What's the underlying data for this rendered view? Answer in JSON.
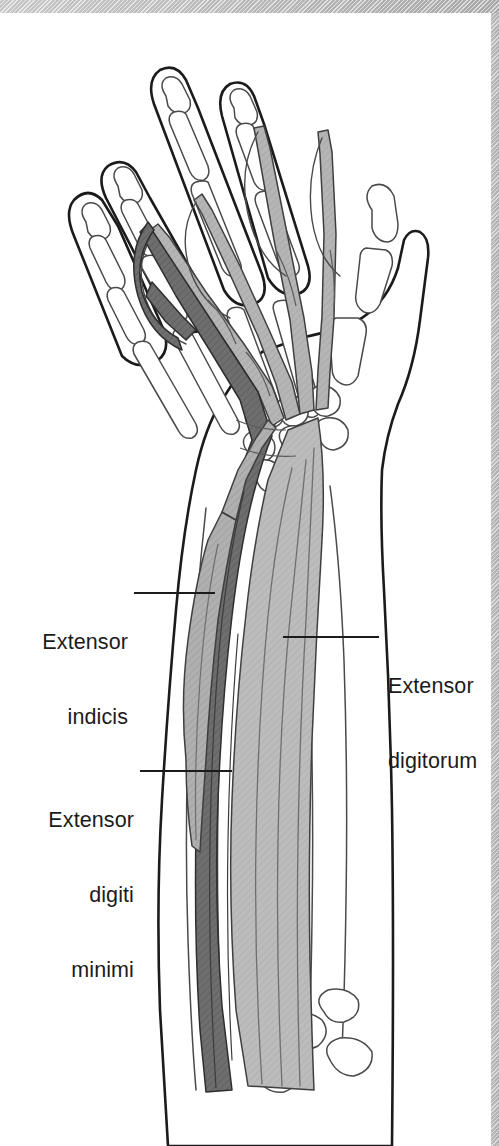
{
  "figure": {
    "view": "Posterior (dorsal) view of right forearm and hand",
    "background_color": "#ffffff",
    "banner_color": "#c4c4c4",
    "line_color": "#1b1b1b",
    "label_color": "#1b1b1b"
  },
  "labels": [
    {
      "id": "extensor-indicis",
      "line1": "Extensor",
      "line2": "indicis",
      "align": "right",
      "text_x": 128,
      "text_y": 580,
      "leader": {
        "x1": 134,
        "y1": 593,
        "x2": 215,
        "y2": 593
      },
      "muscle_color": "#b0b0b0"
    },
    {
      "id": "extensor-digitorum",
      "line1": "Extensor",
      "line2": "digitorum",
      "align": "left",
      "text_x": 388,
      "text_y": 624,
      "leader": {
        "x1": 283,
        "y1": 637,
        "x2": 379,
        "y2": 637
      },
      "muscle_color": "#b8b8b8"
    },
    {
      "id": "extensor-digiti-minimi",
      "line1": "Extensor",
      "line2": "digiti",
      "line3": "minimi",
      "align": "right",
      "text_x": 138,
      "text_y": 758,
      "leader": {
        "x1": 140,
        "y1": 771,
        "x2": 232,
        "y2": 771
      },
      "muscle_color": "#6e6e6e"
    }
  ],
  "structures": {
    "extensor_digitorum": {
      "name": "Extensor digitorum",
      "fill": "#bcbcbc",
      "hatch": "diagonal",
      "description": "Large light-grey muscle belly in the posterior forearm giving four tendons to the index, middle, ring and little fingers"
    },
    "extensor_digiti_minimi": {
      "name": "Extensor digiti minimi",
      "fill": "#6e6e6e",
      "hatch": "diagonal",
      "description": "Dark-grey slender muscle medial to extensor digitorum, tendon passing to the little finger"
    },
    "extensor_indicis": {
      "name": "Extensor indicis",
      "fill": "#a8a8a8",
      "hatch": "diagonal",
      "description": "Deep muscle arising from the distal ulna, tendon running to the index finger"
    },
    "skeleton": {
      "name": "Hand and forearm skeleton",
      "fill": "#ffffff",
      "stroke": "#3a3a3a",
      "description": "Outlined radius, ulna, carpals, metacarpals and phalanges seen through the skin outline"
    },
    "skin_outline": {
      "name": "Skin contour of hand and forearm",
      "stroke": "#1b1b1b"
    }
  }
}
